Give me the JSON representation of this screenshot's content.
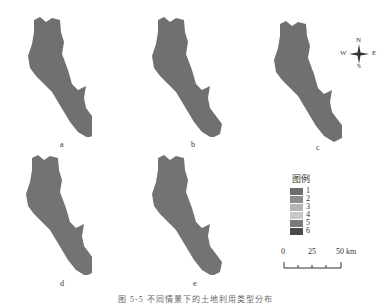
{
  "figure": {
    "panels": [
      {
        "id": "a",
        "label": "a"
      },
      {
        "id": "b",
        "label": "b"
      },
      {
        "id": "c",
        "label": "c"
      },
      {
        "id": "d",
        "label": "d"
      },
      {
        "id": "e",
        "label": "e"
      }
    ],
    "compass": {
      "n": "N",
      "s": "S",
      "w": "W",
      "e": "E"
    },
    "legend": {
      "title": "图例",
      "items": [
        {
          "label": "1",
          "color": "#6e6e6e"
        },
        {
          "label": "2",
          "color": "#8c8c8c"
        },
        {
          "label": "3",
          "color": "#b4b4b4"
        },
        {
          "label": "4",
          "color": "#c8c8c8"
        },
        {
          "label": "5",
          "color": "#7a7a7a"
        },
        {
          "label": "6",
          "color": "#4a4a4a"
        }
      ]
    },
    "scalebar": {
      "ticks": [
        "0",
        "25",
        "50 km"
      ]
    },
    "caption": "图 5-5  不同情景下的土地利用类型分布"
  },
  "colors": {
    "region_fill": "#6f6f6f",
    "region_texture": "#808080"
  }
}
